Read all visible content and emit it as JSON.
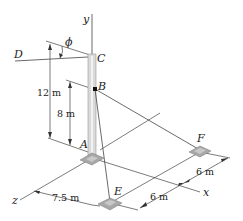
{
  "diagram": {
    "type": "3D statics figure",
    "points": {
      "A": "A",
      "B": "B",
      "C": "C",
      "D": "D",
      "E": "E",
      "F": "F"
    },
    "axes": {
      "x": "x",
      "y": "y",
      "z": "z"
    },
    "angle_label": "ϕ",
    "dimensions": {
      "height_C": "12 m",
      "height_B": "8 m",
      "z_offset_E": "7.5 m",
      "x_offset_E": "6 m",
      "x_offset_F": "6 m"
    },
    "colors": {
      "line": "#333333",
      "pole_fill": "#d9d9d9",
      "pole_edge": "#9a9a9a",
      "base_fill": "#a8a8a8"
    }
  }
}
